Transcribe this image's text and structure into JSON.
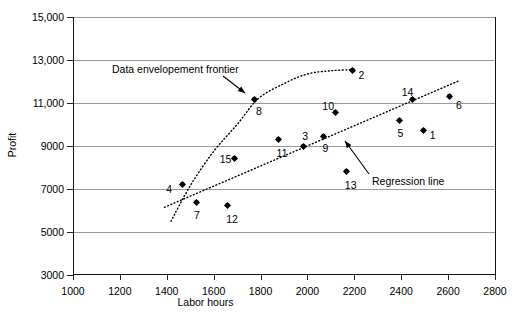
{
  "chart_data": {
    "type": "scatter",
    "title": "",
    "xlabel": "Labor hours",
    "ylabel": "Profit",
    "xlim": [
      1000,
      2800
    ],
    "ylim": [
      3000,
      15000
    ],
    "xticks": [
      "1000",
      "1200",
      "1400",
      "1600",
      "1800",
      "2000",
      "2200",
      "2400",
      "2600",
      "2800"
    ],
    "yticks": [
      "3000",
      "5000",
      "7000",
      "9000",
      "11,000",
      "13,000",
      "15,000"
    ],
    "grid": "horizontal",
    "legend": "none",
    "point_label_field": "label",
    "points": [
      {
        "label": "1",
        "x": 2496,
        "y": 9700,
        "label_dx": 6,
        "label_dy": -1
      },
      {
        "label": "2",
        "x": 2192,
        "y": 12500,
        "label_dx": 6,
        "label_dy": -1
      },
      {
        "label": "3",
        "x": 1982,
        "y": 9000,
        "label_dx": -1,
        "label_dy": -15
      },
      {
        "label": "4",
        "x": 1466,
        "y": 7200,
        "label_dx": -16,
        "label_dy": -1
      },
      {
        "label": "5",
        "x": 2393,
        "y": 10200,
        "label_dx": -2,
        "label_dy": 8
      },
      {
        "label": "6",
        "x": 2608,
        "y": 11300,
        "label_dx": 6,
        "label_dy": 3
      },
      {
        "label": "7",
        "x": 1525,
        "y": 6350,
        "label_dx": -2,
        "label_dy": 7
      },
      {
        "label": "8",
        "x": 1776,
        "y": 11150,
        "label_dx": 1,
        "label_dy": 6
      },
      {
        "label": "9",
        "x": 2068,
        "y": 9450,
        "label_dx": -1,
        "label_dy": 7
      },
      {
        "label": "10",
        "x": 2119,
        "y": 10550,
        "label_dx": -13,
        "label_dy": -12
      },
      {
        "label": "11",
        "x": 1877,
        "y": 9300,
        "label_dx": -2,
        "label_dy": 8
      },
      {
        "label": "12",
        "x": 1658,
        "y": 6250,
        "label_dx": -1,
        "label_dy": 9
      },
      {
        "label": "13",
        "x": 2168,
        "y": 7800,
        "label_dx": -2,
        "label_dy": 8
      },
      {
        "label": "14",
        "x": 2449,
        "y": 11150,
        "label_dx": -11,
        "label_dy": -13
      },
      {
        "label": "15",
        "x": 1690,
        "y": 8400,
        "label_dx": -15,
        "label_dy": -5
      }
    ],
    "curves": [
      {
        "name": "Data envelopement frontier",
        "style": "dotted",
        "points": [
          {
            "x": 1418,
            "y": 5500
          },
          {
            "x": 1500,
            "y": 7150
          },
          {
            "x": 1600,
            "y": 8750
          },
          {
            "x": 1700,
            "y": 10000
          },
          {
            "x": 1790,
            "y": 11200
          },
          {
            "x": 1900,
            "y": 11900
          },
          {
            "x": 2000,
            "y": 12350
          },
          {
            "x": 2100,
            "y": 12500
          },
          {
            "x": 2192,
            "y": 12550
          }
        ]
      },
      {
        "name": "Regression line",
        "style": "dotted",
        "points": [
          {
            "x": 1390,
            "y": 6150
          },
          {
            "x": 2650,
            "y": 12050
          }
        ]
      }
    ],
    "annotations": [
      {
        "name": "frontier-annotation",
        "text": "Data envelopement frontier",
        "text_x": 112,
        "text_y": 63,
        "arrow_from_x": 223,
        "arrow_from_y": 76,
        "arrow_to_x": 245,
        "arrow_to_y": 93
      },
      {
        "name": "regression-annotation",
        "text": "Regression line",
        "text_x": 372,
        "text_y": 175,
        "arrow_from_x": 369,
        "arrow_from_y": 174,
        "arrow_to_x": 345,
        "arrow_to_y": 141
      }
    ],
    "colors": {
      "marker": "#000000",
      "gridline": "#9a9a9a",
      "axis": "#111111",
      "curve": "#000000",
      "background": "#ffffff"
    }
  }
}
